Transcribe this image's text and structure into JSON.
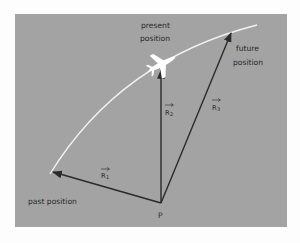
{
  "diagram": {
    "background_color": "#a3a3a3",
    "trajectory_color": "#f2f2f2",
    "vector_color": "#2a2a2a",
    "labels": {
      "present_line1": "present",
      "present_line2": "position",
      "future_line1": "future",
      "future_line2": "position",
      "past": "past position",
      "origin": "P"
    },
    "vectors": [
      {
        "name": "R1",
        "letter": "R",
        "sub": "1",
        "from": "P",
        "to": "past position"
      },
      {
        "name": "R2",
        "letter": "R",
        "sub": "2",
        "from": "P",
        "to": "present position"
      },
      {
        "name": "R3",
        "letter": "R",
        "sub": "3",
        "from": "P",
        "to": "future position"
      }
    ],
    "icons": {
      "airplane": "airplane-icon"
    }
  }
}
